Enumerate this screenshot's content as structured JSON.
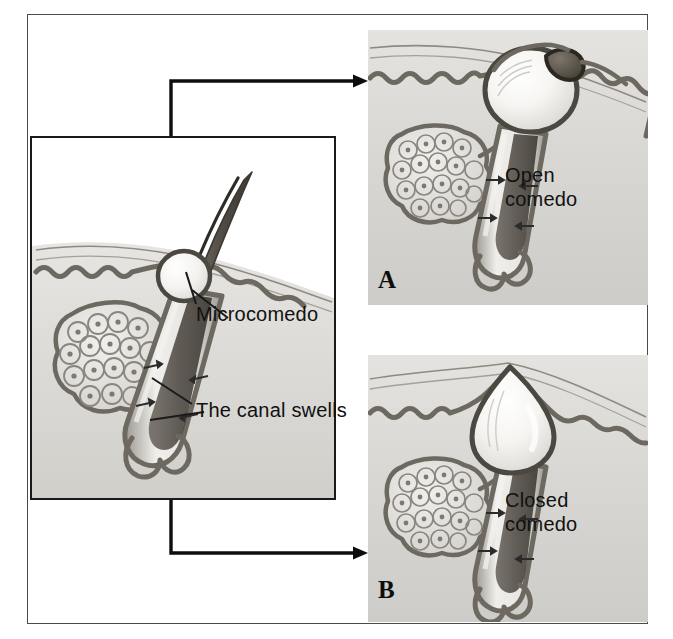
{
  "figure": {
    "type": "medical-illustration",
    "background_color": "#ffffff",
    "frame_color": "#4a4a4a",
    "skin_tone": "#d9d9d6",
    "ink_color": "#111111"
  },
  "inset": {
    "name": "microcomedo-panel",
    "border_color": "#1a1a1a",
    "background": "#ffffff",
    "labels": {
      "microcomedo": "Microcomedo",
      "canal_swells": "The canal swells"
    },
    "structures": [
      "hair shaft",
      "epidermis",
      "sebaceous gland",
      "follicular canal",
      "hair bulb"
    ]
  },
  "panels": [
    {
      "id": "A",
      "name": "open-comedo-panel",
      "letter": "A",
      "caption": "Open\ncomedo",
      "caption_line1": "Open",
      "caption_line2": "comedo",
      "plug_color": "#5d574f",
      "comedo_fill": "#f2f1ee",
      "description": "open comedo (blackhead) with dark surface plug"
    },
    {
      "id": "B",
      "name": "closed-comedo-panel",
      "letter": "B",
      "caption": "Closed\ncomedo",
      "caption_line1": "Closed",
      "caption_line2": "comedo",
      "plug_color": "none",
      "comedo_fill": "#f4f3f0",
      "description": "closed comedo (whitehead) covered by epidermis"
    }
  ],
  "connectors": [
    {
      "name": "arrow-to-open-comedo",
      "from": "microcomedo-panel",
      "to": "open-comedo-panel",
      "color": "#0d0d0d"
    },
    {
      "name": "arrow-to-closed-comedo",
      "from": "microcomedo-panel",
      "to": "closed-comedo-panel",
      "color": "#0d0d0d"
    }
  ]
}
